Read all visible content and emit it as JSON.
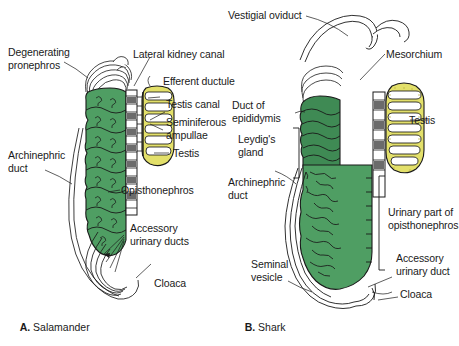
{
  "figure": {
    "background_color": "#ffffff",
    "width": 459,
    "height": 346
  },
  "colors": {
    "kidney_green": "#4f9e63",
    "kidney_green_dark": "#2f7a44",
    "testis_yellow": "#e3e06a",
    "testis_yellow_dark": "#b8b23a",
    "outline": "#1a1a1a",
    "duct_white": "#ffffff",
    "tubule_gray": "#555555",
    "text": "#1a1a1a"
  },
  "panels": [
    {
      "id": "panel-a",
      "caption_letter": "A.",
      "caption_name": "Salamander",
      "labels": [
        {
          "id": "degenerating-pronephros",
          "text": "Degenerating\npronephros"
        },
        {
          "id": "lateral-kidney-canal",
          "text": "Lateral kidney canal"
        },
        {
          "id": "efferent-ductule",
          "text": "Efferent ductule"
        },
        {
          "id": "testis-canal",
          "text": "Testis canal"
        },
        {
          "id": "seminiferous-ampullae",
          "text": "Seminiferous\nampullae"
        },
        {
          "id": "testis",
          "text": "Testis"
        },
        {
          "id": "archinephric-duct",
          "text": "Archinephric\nduct"
        },
        {
          "id": "opisthonephros",
          "text": "Opisthonephros"
        },
        {
          "id": "accessory-urinary-ducts",
          "text": "Accessory\nurinary ducts"
        },
        {
          "id": "cloaca",
          "text": "Cloaca"
        }
      ]
    },
    {
      "id": "panel-b",
      "caption_letter": "B.",
      "caption_name": "Shark",
      "labels": [
        {
          "id": "vestigial-oviduct",
          "text": "Vestigial oviduct"
        },
        {
          "id": "mesorchium",
          "text": "Mesorchium"
        },
        {
          "id": "duct-of-epididymis",
          "text": "Duct of\nepididymis"
        },
        {
          "id": "testis",
          "text": "Testis"
        },
        {
          "id": "leydigs-gland",
          "text": "Leydig's\ngland"
        },
        {
          "id": "archinephric-duct",
          "text": "Archinephric\nduct"
        },
        {
          "id": "urinary-part-of-opisthonephros",
          "text": "Urinary part of\nopisthonephros"
        },
        {
          "id": "seminal-vesicle",
          "text": "Seminal\nvesicle"
        },
        {
          "id": "accessory-urinary-duct",
          "text": "Accessory\nurinary duct"
        },
        {
          "id": "cloaca",
          "text": "Cloaca"
        }
      ]
    }
  ],
  "text": {
    "a_degenerating_pronephros": "Degenerating\npronephros",
    "a_lateral_kidney_canal": "Lateral kidney canal",
    "a_efferent_ductule": "Efferent ductule",
    "a_testis_canal": "Testis canal",
    "a_seminiferous_ampullae": "Seminiferous\nampullae",
    "a_testis": "Testis",
    "a_archinephric_duct": "Archinephric\nduct",
    "a_opisthonephros": "Opisthonephros",
    "a_accessory_urinary_ducts": "Accessory\nurinary ducts",
    "a_cloaca": "Cloaca",
    "a_caption_letter": "A.",
    "a_caption_name": " Salamander",
    "b_vestigial_oviduct": "Vestigial oviduct",
    "b_mesorchium": "Mesorchium",
    "b_duct_of_epididymis": "Duct of\nepididymis",
    "b_testis": "Testis",
    "b_leydigs_gland": "Leydig's\ngland",
    "b_archinephric_duct": "Archinephric\nduct",
    "b_urinary_part": "Urinary part of\nopisthonephros",
    "b_seminal_vesicle": "Seminal\nvesicle",
    "b_accessory_urinary_duct": "Accessory\nurinary duct",
    "b_cloaca": "Cloaca",
    "b_caption_letter": "B.",
    "b_caption_name": " Shark"
  }
}
